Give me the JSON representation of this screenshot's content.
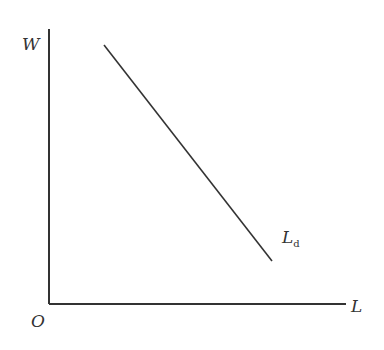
{
  "diagram": {
    "type": "labor-demand-curve",
    "y_axis_label": "W",
    "x_axis_label": "L",
    "origin_label": "O",
    "curve": {
      "label_main": "L",
      "label_sub": "d",
      "description": "downward-sloping labor demand line",
      "start": [
        104,
        45
      ],
      "end": [
        272,
        261
      ]
    },
    "colors": {
      "line": "#333333",
      "background": "#ffffff"
    }
  }
}
